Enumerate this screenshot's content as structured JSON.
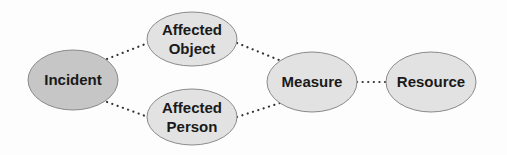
{
  "diagram": {
    "colors": {
      "background": "#fdfdfd",
      "primary_fill": "#c6c6c6",
      "secondary_fill": "#e2e2e2",
      "stroke": "#8a8a8a",
      "edge": "#333333",
      "text": "#1a1a1a"
    },
    "nodes": [
      {
        "id": "incident",
        "lines": [
          "Incident"
        ],
        "cx": 73,
        "cy": 80,
        "rx": 45,
        "ry": 30,
        "fill": "#c6c6c6"
      },
      {
        "id": "affected-object",
        "lines": [
          "Affected",
          "Object"
        ],
        "cx": 192,
        "cy": 39,
        "rx": 45,
        "ry": 27,
        "fill": "#e2e2e2"
      },
      {
        "id": "affected-person",
        "lines": [
          "Affected",
          "Person"
        ],
        "cx": 192,
        "cy": 117,
        "rx": 45,
        "ry": 28,
        "fill": "#e2e2e2"
      },
      {
        "id": "measure",
        "lines": [
          "Measure"
        ],
        "cx": 312,
        "cy": 82,
        "rx": 45,
        "ry": 30,
        "fill": "#e2e2e2"
      },
      {
        "id": "resource",
        "lines": [
          "Resource"
        ],
        "cx": 431,
        "cy": 82,
        "rx": 45,
        "ry": 30,
        "fill": "#e2e2e2"
      }
    ],
    "edges": [
      {
        "from": "incident",
        "to": "affected-object",
        "x1": 107,
        "y1": 59,
        "x2": 148,
        "y2": 43
      },
      {
        "from": "incident",
        "to": "affected-person",
        "x1": 107,
        "y1": 102,
        "x2": 148,
        "y2": 117
      },
      {
        "from": "affected-object",
        "to": "measure",
        "x1": 237,
        "y1": 43,
        "x2": 279,
        "y2": 60
      },
      {
        "from": "affected-person",
        "to": "measure",
        "x1": 237,
        "y1": 117,
        "x2": 280,
        "y2": 103
      },
      {
        "from": "measure",
        "to": "resource",
        "x1": 357,
        "y1": 82,
        "x2": 386,
        "y2": 82
      }
    ]
  }
}
